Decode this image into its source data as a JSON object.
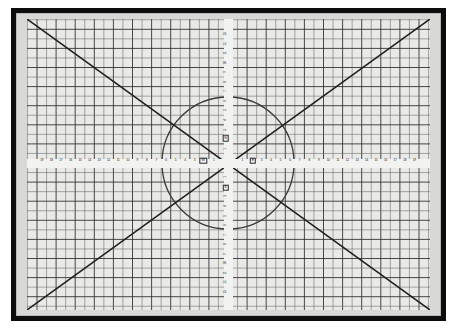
{
  "object": {
    "name": "self-healing cutting mat",
    "frame_color": "#0d0d0d",
    "surface_color": "#e9e9e7",
    "grid_line_color": "#5a5a5a",
    "major_line_color": "#2b2b2b",
    "diagonal_color": "#1f1f1f",
    "circle_color": "#3a3a3a",
    "label_color": "#1a1a1a"
  },
  "board": {
    "cell_px": 9.55,
    "cols": 42,
    "rows": 30,
    "major_every": 2,
    "diagonals": 2,
    "circle": {
      "cx_px": 201,
      "cy_px": 144,
      "r_px": 66
    }
  },
  "markers": {
    "west_label": "W",
    "east_label": "E",
    "north_label": "N",
    "south_label": "S"
  },
  "ruler_horizontal": {
    "orientation": "horizontal",
    "left_labels": [
      "19",
      "18",
      "17",
      "16",
      "15",
      "14",
      "13",
      "12",
      "11",
      "10",
      "9",
      "8",
      "7",
      "6",
      "5",
      "4",
      "3",
      "2",
      "1"
    ],
    "right_labels": [
      "1",
      "2",
      "3",
      "4",
      "5",
      "6",
      "7",
      "8",
      "9",
      "10",
      "11",
      "12",
      "13",
      "14",
      "15",
      "16",
      "17",
      "18",
      "19"
    ]
  },
  "ruler_vertical": {
    "orientation": "vertical",
    "top_labels": [
      "13",
      "12",
      "11",
      "10",
      "9",
      "8",
      "7",
      "6",
      "5",
      "4",
      "3",
      "2",
      "1"
    ],
    "bottom_labels": [
      "1",
      "2",
      "3",
      "4",
      "5",
      "6",
      "7",
      "8",
      "9",
      "10",
      "11",
      "12",
      "13"
    ]
  },
  "chart_data": {
    "type": "scatter",
    "title": "",
    "xlabel": "",
    "ylabel": "",
    "grid": true,
    "x": [],
    "values": []
  }
}
